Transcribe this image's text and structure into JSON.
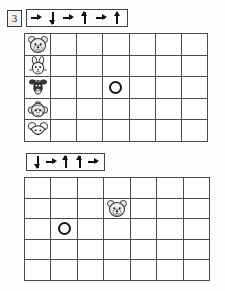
{
  "worksheet": {
    "exercise_number": "3",
    "title_visible": false
  },
  "sections": [
    {
      "id": "section-1",
      "exercise_number": "3",
      "arrow_sequence": [
        "right",
        "down",
        "right",
        "up",
        "right",
        "up"
      ],
      "arrow_glyphs": [
        "→",
        "↓",
        "→",
        "↑",
        "→",
        "↑"
      ],
      "grid": {
        "columns": 7,
        "rows": 5,
        "row_labels": [
          "bear",
          "rabbit",
          "cow",
          "monkey",
          "mouse"
        ],
        "markers": [
          {
            "type": "circle",
            "row": 3,
            "column": 4,
            "label": "O"
          }
        ]
      }
    },
    {
      "id": "section-2",
      "arrow_sequence": [
        "down",
        "right",
        "up",
        "up",
        "right"
      ],
      "arrow_glyphs": [
        "↓",
        "→",
        "↑",
        "↑",
        "→"
      ],
      "grid": {
        "columns": 7,
        "rows": 5,
        "row_labels": [],
        "markers": [
          {
            "type": "bear-face",
            "row": 2,
            "column": 4,
            "label": "bear"
          },
          {
            "type": "circle",
            "row": 3,
            "column": 2,
            "label": "O"
          }
        ]
      }
    }
  ],
  "colors": {
    "ink": "#161616",
    "grid_line": "#4a4a4a",
    "paper": "#ffffff",
    "badge_fill": "#f2f2f2"
  },
  "icons": {
    "bear": "bear-face-icon",
    "rabbit": "rabbit-face-icon",
    "cow": "cow-face-icon",
    "monkey": "monkey-face-icon",
    "mouse": "mouse-face-icon",
    "circle": "circle-token-icon",
    "arrow_right": "arrow-right-icon",
    "arrow_up": "arrow-up-icon",
    "arrow_down": "arrow-down-icon"
  }
}
